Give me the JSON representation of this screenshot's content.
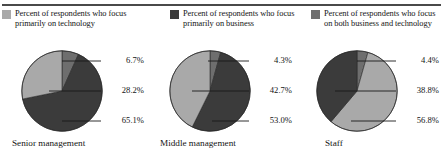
{
  "colors": {
    "technology": "#a9a9a9",
    "business": "#3b3b3b",
    "both": "#6e6e6e",
    "rule": "#4a4a4a",
    "leader": "#1a1a1a",
    "text": "#141414",
    "background": "#ffffff"
  },
  "legend": {
    "items": [
      {
        "label": "Percent of respondents who focus primarily on technology",
        "swatch_name": "legend-swatch-technology",
        "color_key": "technology"
      },
      {
        "label": "Percent of respondents who focus primarily on business",
        "swatch_name": "legend-swatch-business",
        "color_key": "business"
      },
      {
        "label": "Percent of respondents who focus on both business and technology",
        "swatch_name": "legend-swatch-both",
        "color_key": "both"
      }
    ]
  },
  "chart_data": [
    {
      "type": "pie",
      "title": "Senior management",
      "categories": [
        "Percent of respondents who focus on both business and technology",
        "Percent of respondents who focus primarily on business",
        "Percent of respondents who focus primarily on technology"
      ],
      "values": [
        6.7,
        65.1,
        28.2
      ],
      "labels": [
        "6.7%",
        "65.1%",
        "28.2%"
      ],
      "label_order_top_to_bottom": [
        "6.7%",
        "28.2%",
        "65.1%"
      ],
      "colors": [
        "#6e6e6e",
        "#3b3b3b",
        "#a9a9a9"
      ],
      "legend_position": "top",
      "grid": false
    },
    {
      "type": "pie",
      "title": "Middle management",
      "categories": [
        "Percent of respondents who focus on both business and technology",
        "Percent of respondents who focus primarily on business",
        "Percent of respondents who focus primarily on technology"
      ],
      "values": [
        4.3,
        53.0,
        42.7
      ],
      "labels": [
        "4.3%",
        "53.0%",
        "42.7%"
      ],
      "label_order_top_to_bottom": [
        "4.3%",
        "42.7%",
        "53.0%"
      ],
      "colors": [
        "#6e6e6e",
        "#3b3b3b",
        "#a9a9a9"
      ],
      "legend_position": "top",
      "grid": false
    },
    {
      "type": "pie",
      "title": "Staff",
      "categories": [
        "Percent of respondents who focus on both business and technology",
        "Percent of respondents who focus primarily on technology",
        "Percent of respondents who focus primarily on business"
      ],
      "values": [
        4.4,
        56.8,
        38.8
      ],
      "labels": [
        "4.4%",
        "56.8%",
        "38.8%"
      ],
      "label_order_top_to_bottom": [
        "4.4%",
        "38.8%",
        "56.8%"
      ],
      "colors": [
        "#6e6e6e",
        "#a9a9a9",
        "#3b3b3b"
      ],
      "legend_position": "top",
      "grid": false
    }
  ]
}
